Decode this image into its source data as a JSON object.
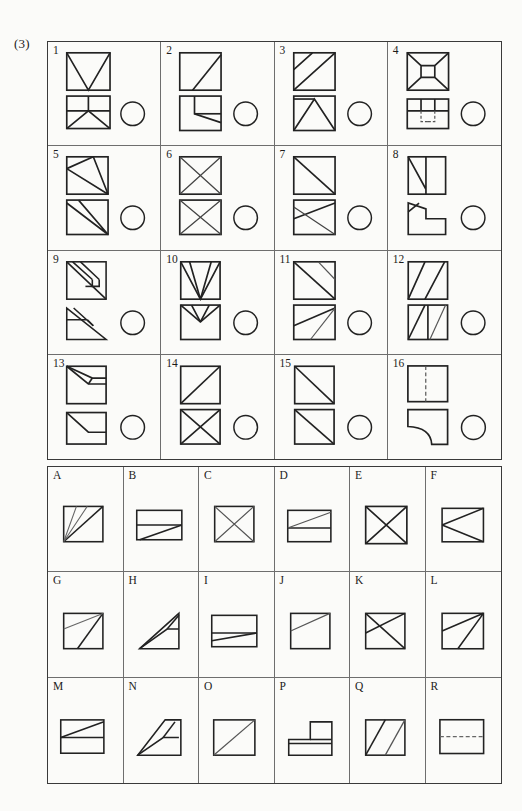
{
  "figure": {
    "number_label": "(3)",
    "type": "orthographic-projection-matching-exercise",
    "stroke_color": "#222222",
    "thin_stroke_color": "#555555",
    "page_background": "#fbfbf9"
  },
  "problem_grid": {
    "columns": 4,
    "rows": 4,
    "item_count": 16,
    "answer_circle_present": true,
    "items": [
      {
        "label": "1",
        "top_view": "square-with-V-shape-from-top-corners-to-bottom-center",
        "front_view": "rectangle-split-by-horizontal-and-vertical-with-V-below",
        "answer_blank": "circle"
      },
      {
        "label": "2",
        "top_view": "square-with-diagonal-from-bottom-left-to-top-right-partial",
        "front_view": "square-with-inner-rectangle-and-slanted-edge",
        "answer_blank": "circle"
      },
      {
        "label": "3",
        "top_view": "square-with-two-parallel-diagonals",
        "front_view": "square-with-triangle-peak-and-left-diagonal",
        "answer_blank": "circle"
      },
      {
        "label": "4",
        "top_view": "square-with-inner-X-bowtie-to-center-rectangle",
        "front_view": "rectangle-with-grid-cells-and-hidden-dashed-lines",
        "answer_blank": "circle"
      },
      {
        "label": "5",
        "top_view": "square-with-triangle-from-top-right-to-left-edge",
        "front_view": "square-with-two-diagonals-to-bottom-right",
        "answer_blank": "circle"
      },
      {
        "label": "6",
        "top_view": "square-with-full-X-diagonals",
        "front_view": "square-with-full-X-diagonals",
        "answer_blank": "circle"
      },
      {
        "label": "7",
        "top_view": "square-with-diagonal-top-left-to-bottom-right",
        "front_view": "square-with-crossing-lines-forming-bowtie",
        "answer_blank": "circle"
      },
      {
        "label": "8",
        "top_view": "rectangle-with-vertical-line-and-diagonal",
        "front_view": "L-shaped-polygon-with-chamfer",
        "answer_blank": "circle"
      },
      {
        "label": "9",
        "top_view": "square-with-parallel-slot-and-box-detail",
        "front_view": "triangle-with-parallel-slot-lines",
        "answer_blank": "circle"
      },
      {
        "label": "10",
        "top_view": "square-with-three-converging-lines-to-bottom-center",
        "front_view": "square-with-V-notch-at-top",
        "answer_blank": "circle"
      },
      {
        "label": "11",
        "top_view": "square-with-main-diagonal-and-short-diagonal",
        "front_view": "square-with-fan-lines-from-top-right",
        "answer_blank": "circle"
      },
      {
        "label": "12",
        "top_view": "square-with-two-parallel-diagonals-slanted-right",
        "front_view": "square-with-vertical-divider-and-two-diagonals",
        "answer_blank": "circle"
      },
      {
        "label": "13",
        "top_view": "square-with-wedge-and-horizontal-step",
        "front_view": "square-with-slanted-step-line",
        "answer_blank": "circle"
      },
      {
        "label": "14",
        "top_view": "square-with-diagonal-bottom-left-to-top-right",
        "front_view": "square-with-full-X-diagonals",
        "answer_blank": "circle"
      },
      {
        "label": "15",
        "top_view": "square-with-diagonal-top-left-to-bottom-right",
        "front_view": "square-with-diagonal-top-left-to-bottom-right",
        "answer_blank": "circle"
      },
      {
        "label": "16",
        "top_view": "rectangle-with-vertical-dashed-center-line",
        "front_view": "square-with-concave-quarter-round-cut",
        "answer_blank": "circle"
      }
    ]
  },
  "options_grid": {
    "columns": 6,
    "rows": 3,
    "item_count": 18,
    "items": [
      {
        "label": "A",
        "shape": "square-with-diagonal-and-thin-fan-line-from-bottom-left"
      },
      {
        "label": "B",
        "shape": "rectangle-with-horizontal-divider-and-rising-diagonal"
      },
      {
        "label": "C",
        "shape": "square-with-full-X-diagonals-thin"
      },
      {
        "label": "D",
        "shape": "rectangle-with-horizontal-divider-and-thin-rising-diagonal"
      },
      {
        "label": "E",
        "shape": "square-with-full-X-diagonals-bold"
      },
      {
        "label": "F",
        "shape": "square-with-left-pointing-triangle"
      },
      {
        "label": "G",
        "shape": "square-with-diagonal-and-thin-line-from-left-edge"
      },
      {
        "label": "H",
        "shape": "right-triangle-with-inner-notch"
      },
      {
        "label": "I",
        "shape": "rectangle-with-horizontal-divider-and-slight-slant"
      },
      {
        "label": "J",
        "shape": "square-with-thin-diagonal-left-to-top-right"
      },
      {
        "label": "K",
        "shape": "square-with-crossing-diagonals-bowtie"
      },
      {
        "label": "L",
        "shape": "square-with-two-lines-converging-at-top-right"
      },
      {
        "label": "M",
        "shape": "rectangle-with-horizontal-divider-and-rising-diagonal"
      },
      {
        "label": "N",
        "shape": "parallelogram-with-inner-slot"
      },
      {
        "label": "O",
        "shape": "square-with-thin-diagonal-bottom-left-to-top-right"
      },
      {
        "label": "P",
        "shape": "stepped-L-shaped-block"
      },
      {
        "label": "Q",
        "shape": "square-with-two-parallel-diagonals"
      },
      {
        "label": "R",
        "shape": "rectangle-with-dashed-horizontal-center-line"
      }
    ]
  }
}
